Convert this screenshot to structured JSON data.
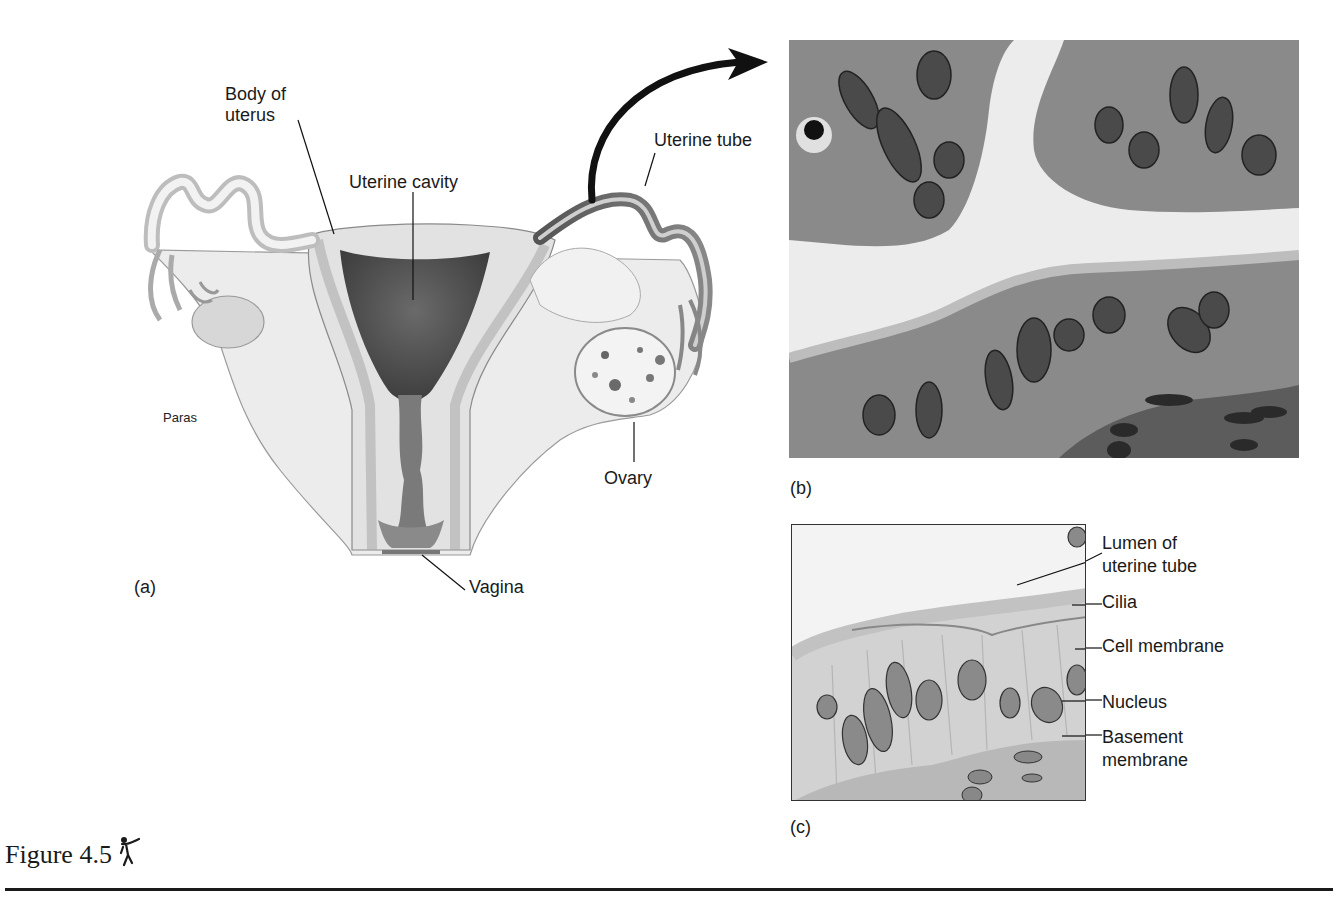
{
  "figure": {
    "caption": "Figure 4.5",
    "caption_icon": "tutor-figure-icon"
  },
  "panel_a": {
    "tag": "(a)",
    "labels": {
      "body_of_uterus_line1": "Body of",
      "body_of_uterus_line2": "uterus",
      "uterine_cavity": "Uterine cavity",
      "uterine_tube": "Uterine tube",
      "paras": "Paras",
      "ovary": "Ovary",
      "vagina": "Vagina"
    }
  },
  "panel_b": {
    "tag": "(b)"
  },
  "panel_c": {
    "tag": "(c)",
    "labels": {
      "lumen_line1": "Lumen of",
      "lumen_line2": "uterine tube",
      "cilia": "Cilia",
      "cell_membrane": "Cell membrane",
      "nucleus": "Nucleus",
      "basement_line1": "Basement",
      "basement_line2": "membrane"
    }
  },
  "colors": {
    "ink": "#1a1a1a",
    "tissue_light": "#e6e6e6",
    "tissue_mid": "#b5b5b5",
    "tissue_dark": "#555555",
    "micro_bg": "#8e8e8e"
  }
}
